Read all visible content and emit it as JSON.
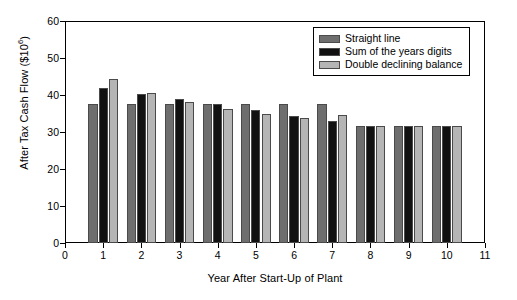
{
  "chart_data": {
    "type": "bar",
    "title": "",
    "xlabel": "Year After Start-Up of Plant",
    "ylabel": "After Tax Cash Flow ($10⁶)",
    "ylabel_base": "After Tax Cash Flow ($10",
    "ylabel_exponent": "6",
    "ylabel_tail": ")",
    "categories": [
      1,
      2,
      3,
      4,
      5,
      6,
      7,
      8,
      9,
      10
    ],
    "x_tick_labels": [
      "0",
      "1",
      "2",
      "3",
      "4",
      "5",
      "6",
      "7",
      "8",
      "9",
      "10",
      "11"
    ],
    "x_tick_values": [
      0,
      1,
      2,
      3,
      4,
      5,
      6,
      7,
      8,
      9,
      10,
      11
    ],
    "y_tick_labels": [
      "0",
      "10",
      "20",
      "30",
      "40",
      "50",
      "60"
    ],
    "y_tick_values": [
      0,
      10,
      20,
      30,
      40,
      50,
      60
    ],
    "xlim": [
      0,
      11
    ],
    "ylim": [
      0,
      60
    ],
    "grid": false,
    "legend_position": "top-right",
    "series": [
      {
        "name": "Straight line",
        "color": "#6e6e6e",
        "values": [
          37.5,
          37.5,
          37.5,
          37.5,
          37.5,
          37.5,
          37.5,
          31.5,
          31.5,
          31.5
        ]
      },
      {
        "name": "Sum of the years digits",
        "color": "#111111",
        "values": [
          41.8,
          40.3,
          39.0,
          37.5,
          36.0,
          34.4,
          33.0,
          31.5,
          31.5,
          31.5
        ]
      },
      {
        "name": "Double declining balance",
        "color": "#b5b5b5",
        "values": [
          44.3,
          40.6,
          38.1,
          36.2,
          34.8,
          33.9,
          34.5,
          31.5,
          31.5,
          31.5
        ]
      }
    ]
  }
}
